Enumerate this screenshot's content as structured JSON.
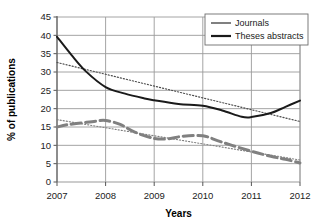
{
  "chart_data": {
    "type": "line",
    "title": "",
    "xlabel": "Years",
    "ylabel": "% of publications",
    "x": [
      2007,
      2008,
      2009,
      2010,
      2011,
      2012
    ],
    "xtick_labels": [
      "2007",
      "2008",
      "2009",
      "2010",
      "2011",
      "2012"
    ],
    "ytick_labels": [
      "0",
      "5",
      "10",
      "15",
      "20",
      "25",
      "30",
      "35",
      "40",
      "45"
    ],
    "ylim": [
      0,
      45
    ],
    "ytick_step": 5,
    "grid": true,
    "legend_position": "top-right",
    "series": [
      {
        "name": "Journals",
        "color": "#808080",
        "style": "dashed-thick",
        "values": [
          15.0,
          16.8,
          11.9,
          12.6,
          8.4,
          5.2
        ],
        "dense_x": [
          2007,
          2007.2,
          2007.5,
          2007.8,
          2008,
          2008.3,
          2008.6,
          2009,
          2009.3,
          2009.6,
          2010,
          2010.3,
          2010.6,
          2011,
          2011.4,
          2011.7,
          2012
        ],
        "dense_y": [
          15.0,
          15.6,
          16.1,
          16.6,
          16.8,
          15.7,
          13.6,
          11.9,
          11.8,
          12.5,
          12.6,
          11.3,
          10.0,
          8.4,
          7.0,
          6.2,
          5.2
        ],
        "trendline": {
          "style": "dotted",
          "color": "#808080",
          "start": 17.0,
          "end": 6.0
        }
      },
      {
        "name": "Theses abstracts",
        "color": "#1a1a1a",
        "style": "solid",
        "values": [
          39.6,
          25.9,
          22.3,
          20.8,
          18.2,
          22.2
        ],
        "dense_x": [
          2007,
          2007.3,
          2007.6,
          2008,
          2008.4,
          2008.8,
          2009,
          2009.5,
          2010,
          2010.4,
          2010.8,
          2011,
          2011.4,
          2011.7,
          2012
        ],
        "dense_y": [
          39.6,
          34.6,
          30.1,
          25.9,
          24.1,
          22.8,
          22.3,
          21.3,
          20.8,
          19.5,
          17.8,
          17.7,
          18.8,
          20.5,
          22.2
        ],
        "trendline": {
          "style": "dotted",
          "color": "#4d4d4d",
          "start": 32.6,
          "end": 16.5
        }
      }
    ],
    "legend": [
      {
        "label": "Journals",
        "color": "#808080",
        "style": "thick-gray"
      },
      {
        "label": "Theses abstracts",
        "color": "#1a1a1a",
        "style": "thick-black"
      }
    ]
  }
}
